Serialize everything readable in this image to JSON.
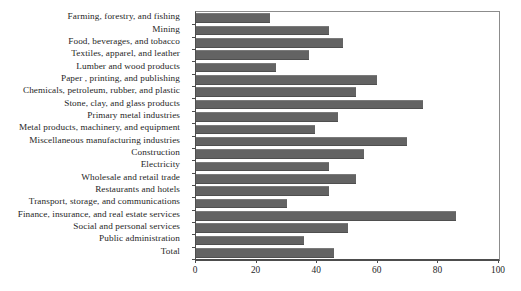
{
  "chart_data": {
    "type": "bar",
    "orientation": "horizontal",
    "title": "",
    "xlabel": "",
    "ylabel": "",
    "xlim": [
      0,
      100
    ],
    "xticks": [
      0,
      20,
      40,
      60,
      80,
      100
    ],
    "grid": false,
    "legend": null,
    "bar_color": "#636363",
    "categories": [
      "Farming, forestry, and fishing",
      "Mining",
      "Food, beverages, and tobacco",
      "Textiles, apparel, and leather",
      "Lumber and wood products",
      "Paper , printing, and publishing",
      "Chemicals, petroleum, rubber, and plastic",
      "Stone, clay, and glass products",
      "Primary metal industries",
      "Metal products, machinery, and equipment",
      "Miscellaneous manufacturing industries",
      "Construction",
      "Electricity",
      "Wholesale and retail trade",
      "Restaurants and hotels",
      "Transport, storage, and communications",
      "Finance, insurance, and real estate services",
      "Social and personal services",
      "Public administration",
      "Total"
    ],
    "values": [
      24.4,
      44.0,
      48.5,
      37.3,
      26.4,
      59.7,
      52.8,
      75.0,
      47.0,
      39.3,
      69.6,
      55.5,
      44.0,
      52.8,
      44.0,
      30.0,
      85.8,
      50.0,
      35.7,
      45.5
    ]
  },
  "axis": {
    "x_tick_labels": [
      "0",
      "20",
      "40",
      "60",
      "80",
      "100"
    ]
  }
}
